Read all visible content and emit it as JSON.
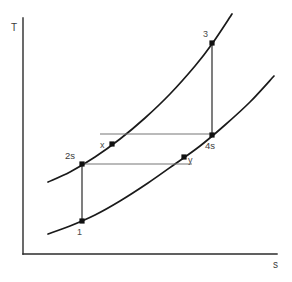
{
  "chart_data": {
    "type": "line",
    "title": "",
    "xlabel": "s",
    "ylabel": "T",
    "grid": false,
    "legend": false,
    "axes": {
      "y_label": "T",
      "x_label": "s",
      "y_axis_x": 23,
      "y_axis_top": 18,
      "y_axis_bottom": 254,
      "x_axis_y": 254,
      "x_axis_left": 23,
      "x_axis_right": 277
    },
    "series": [
      {
        "name": "high-pressure-isobar",
        "kind": "isobar",
        "points": [
          {
            "x": 48,
            "y": 182
          },
          {
            "x": 70,
            "y": 172
          },
          {
            "x": 95,
            "y": 157
          },
          {
            "x": 120,
            "y": 139
          },
          {
            "x": 145,
            "y": 118
          },
          {
            "x": 170,
            "y": 94
          },
          {
            "x": 195,
            "y": 66
          },
          {
            "x": 212,
            "y": 44
          },
          {
            "x": 232,
            "y": 14
          }
        ]
      },
      {
        "name": "low-pressure-isobar",
        "kind": "isobar",
        "points": [
          {
            "x": 48,
            "y": 234
          },
          {
            "x": 70,
            "y": 226
          },
          {
            "x": 95,
            "y": 215
          },
          {
            "x": 120,
            "y": 201
          },
          {
            "x": 148,
            "y": 183
          },
          {
            "x": 175,
            "y": 164
          },
          {
            "x": 200,
            "y": 146
          },
          {
            "x": 225,
            "y": 125
          },
          {
            "x": 250,
            "y": 102
          },
          {
            "x": 274,
            "y": 76
          }
        ]
      }
    ],
    "processes": [
      {
        "name": "isentropic-compression-1-2s",
        "from": "1",
        "to": "2s",
        "type": "vertical",
        "x": 82,
        "y1": 221,
        "y2": 164
      },
      {
        "name": "isentropic-expansion-3-4s",
        "from": "3",
        "to": "4s",
        "type": "vertical",
        "x": 212,
        "y1": 43,
        "y2": 135
      },
      {
        "name": "regenerator-cold-side-x-4s",
        "from": "x",
        "to": "4s",
        "type": "horizontal",
        "y": 134,
        "x1": 100,
        "x2": 213
      },
      {
        "name": "regenerator-hot-side-2s-y",
        "from": "2s",
        "to": "y",
        "type": "horizontal",
        "y": 164,
        "x1": 82,
        "x2": 192
      }
    ],
    "state_points": [
      {
        "label": "1",
        "x": 82,
        "y": 221,
        "label_x": 77,
        "label_y": 235,
        "dot": true
      },
      {
        "label": "2s",
        "x": 82,
        "y": 164,
        "label_x": 65,
        "label_y": 159,
        "dot": true
      },
      {
        "label": "3",
        "x": 212,
        "y": 43,
        "label_x": 203,
        "label_y": 37,
        "dot": true
      },
      {
        "label": "4s",
        "x": 212,
        "y": 135,
        "label_x": 205,
        "label_y": 149,
        "dot": true
      },
      {
        "label": "x",
        "x": 112,
        "y": 144,
        "label_x": 100,
        "label_y": 148,
        "dot": true
      },
      {
        "label": "y",
        "x": 184,
        "y": 157,
        "label_x": 188,
        "label_y": 163,
        "dot": true
      }
    ]
  },
  "colors": {
    "axis": "#2b2b2b",
    "isobar": "#1a1a1a",
    "process_vertical": "#3a3a3a",
    "process_horizontal": "#777777",
    "node": "#111111",
    "text": "#3a3a3a",
    "background": "#ffffff"
  }
}
